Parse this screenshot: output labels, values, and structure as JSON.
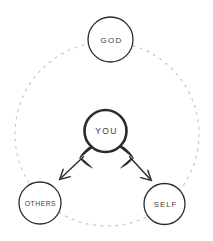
{
  "colors": {
    "background": "#ffffff",
    "ink": "#2b2b2b",
    "label_text": "#3d3d3d",
    "ring_dash": "#c7c7c7"
  },
  "diagram": {
    "nodes": {
      "god": {
        "label": "GOD"
      },
      "you": {
        "label": "YOU"
      },
      "others": {
        "label": "OTHERS"
      },
      "self": {
        "label": "SELF"
      }
    },
    "edges": [
      {
        "from": "YOU",
        "to": "OTHERS",
        "style": "curved-tail-arrow"
      },
      {
        "from": "YOU",
        "to": "SELF",
        "style": "curved-tail-arrow"
      }
    ]
  }
}
